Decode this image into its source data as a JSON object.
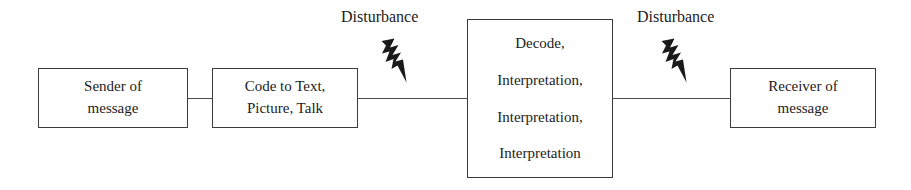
{
  "diagram": {
    "background_color": "#ffffff",
    "line_color": "#4a4a4a",
    "border_color": "#3c3c3c",
    "text_color": "#1c1c1c",
    "bolt_color": "#1a1a1a"
  },
  "nodes": [
    {
      "id": "sender",
      "lines": [
        "Sender of",
        "message"
      ],
      "line1": "Sender of",
      "line2": "message"
    },
    {
      "id": "code",
      "lines": [
        "Code to Text,",
        "Picture, Talk"
      ],
      "line1": "Code to Text,",
      "line2": "Picture, Talk"
    },
    {
      "id": "decode",
      "lines": [
        "Decode,",
        "Interpretation,",
        "Interpretation,",
        "Interpretation"
      ],
      "line1": "Decode,",
      "line2": "Interpretation,",
      "line3": "Interpretation,",
      "line4": "Interpretation"
    },
    {
      "id": "receiver",
      "lines": [
        "Receiver of",
        "message"
      ],
      "line1": "Receiver of",
      "line2": "message"
    }
  ],
  "annotations": {
    "disturbance_1": "Disturbance",
    "disturbance_2": "Disturbance"
  },
  "icons": {
    "bolt_1": "lightning-bolt-icon",
    "bolt_2": "lightning-bolt-icon"
  }
}
